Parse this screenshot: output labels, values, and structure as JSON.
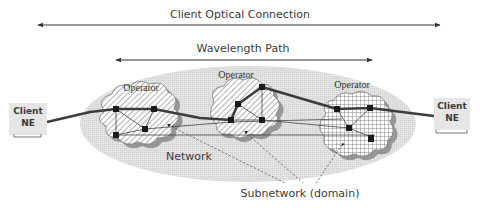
{
  "labels": {
    "client_optical_connection": "Client Optical Connection",
    "wavelength_path": "Wavelength Path",
    "operator_1": "Operator",
    "operator_2": "Operator",
    "operator_3": "Operator",
    "network": "Network",
    "subnetwork": "Subnetwork (domain)"
  },
  "client_left": {
    "line1": "Client",
    "line2": "NE"
  },
  "client_right": {
    "line1": "Client",
    "line2": "NE"
  },
  "colors": {
    "network_fill": "#dcdcdc",
    "link_dark": "#3c3c3c",
    "node": "#1a1a1a",
    "client_box": "#e6e6e6",
    "arrow": "#333333"
  }
}
